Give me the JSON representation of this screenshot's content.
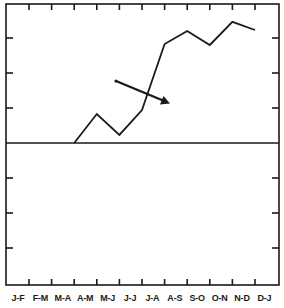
{
  "chart_data": {
    "type": "line",
    "title": "",
    "xlabel": "",
    "ylabel": "",
    "categories": [
      "J-F",
      "F-M",
      "M-A",
      "A-M",
      "M-J",
      "J-J",
      "J-A",
      "A-S",
      "S-O",
      "O-N",
      "N-D",
      "D-J"
    ],
    "series": [
      {
        "name": "series-1",
        "values": [
          null,
          null,
          0.0,
          0.83,
          0.23,
          0.94,
          2.83,
          3.2,
          2.8,
          3.46,
          3.23,
          null
        ]
      }
    ],
    "y_unit": "tick intervals (no numeric y labels shown)",
    "ylim": [
      -4,
      4
    ],
    "y_ticks": [
      -3,
      -2,
      -1,
      0,
      1,
      2,
      3
    ],
    "zero_line": true,
    "grid": false,
    "legend": null,
    "annotations": [
      {
        "type": "arrow",
        "from": {
          "category_index": 4.9,
          "value": 1.77
        },
        "to": {
          "category_index": 7.2,
          "value": 1.14
        },
        "direction": "down-right"
      }
    ]
  },
  "axis": {
    "x_labels": [
      "J-F",
      "F-M",
      "M-A",
      "A-M",
      "M-J",
      "J-J",
      "J-A",
      "A-S",
      "S-O",
      "O-N",
      "N-D",
      "D-J"
    ]
  },
  "colors": {
    "line": "#1a1a1a",
    "frame": "#1a1a1a",
    "background": "#ffffff"
  }
}
